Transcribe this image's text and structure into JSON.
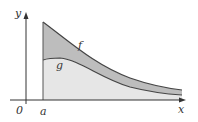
{
  "labels": {
    "y_axis": "y",
    "x_axis": "x",
    "origin": "0",
    "a": "a",
    "f": "f",
    "g": "g"
  },
  "colors": {
    "region_between": "#bdbdbd",
    "region_under_g": "#e6e6e6",
    "curve": "#444444",
    "axis": "#333333"
  }
}
